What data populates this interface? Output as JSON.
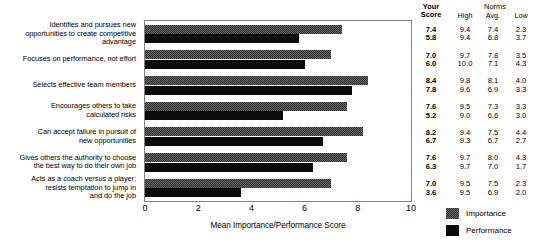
{
  "chart_data": {
    "type": "bar",
    "orientation": "horizontal",
    "title": "",
    "xlabel": "Mean Importance/Performance Score",
    "ylabel": "",
    "xlim": [
      0,
      10
    ],
    "xticks": [
      "0",
      "2",
      "4",
      "6",
      "8",
      "10"
    ],
    "grid": false,
    "legend_position": "right-bottom",
    "categories": [
      "Identifies and pursues new opportunities to create competitive advantage",
      "Focuses on performance, not effort",
      "Selects effective team members",
      "Encourages others to take calculated risks",
      "Can accept failure in pursuit of new opportunities",
      "Gives others the authority to choose the best way to do their own job",
      "Acts as a coach versus a player; resists temptation to jump in and do the job"
    ],
    "category_lines": [
      [
        "Identifies and pursues new",
        "opportunities to create competitive",
        "advantage"
      ],
      [
        "Focuses on performance, not effort"
      ],
      [
        "Selects effective team members"
      ],
      [
        "Encourages others to take",
        "calculated risks"
      ],
      [
        "Can accept failure in pursuit of",
        "new opportunities"
      ],
      [
        "Gives others the authority to choose",
        "the best way to do their own job"
      ],
      [
        "Acts as a coach versus a player;",
        "resists temptation to jump in",
        "and do the job"
      ]
    ],
    "series": [
      {
        "name": "Importance",
        "color": "#6d6d6d",
        "values": [
          7.4,
          7.0,
          8.4,
          7.6,
          8.2,
          7.6,
          7.0
        ]
      },
      {
        "name": "Performance",
        "color": "#0b0b0b",
        "values": [
          5.8,
          6.0,
          7.8,
          5.2,
          6.7,
          6.3,
          3.6
        ]
      }
    ]
  },
  "score_table": {
    "header": {
      "your_score_line1": "Your",
      "your_score_line2": "Score",
      "norms": "Norms",
      "high": "High",
      "avg": "Avg.",
      "low": "Low"
    },
    "rows": [
      {
        "your_importance": "7.4",
        "your_performance": "5.8",
        "high_importance": "9.4",
        "high_performance": "9.4",
        "avg_importance": "7.4",
        "avg_performance": "6.8",
        "low_importance": "2.3",
        "low_performance": "3.7"
      },
      {
        "your_importance": "7.0",
        "your_performance": "6.0",
        "high_importance": "9.7",
        "high_performance": "10.0",
        "avg_importance": "7.8",
        "avg_performance": "7.1",
        "low_importance": "3.5",
        "low_performance": "4.3"
      },
      {
        "your_importance": "8.4",
        "your_performance": "7.8",
        "high_importance": "9.8",
        "high_performance": "9.6",
        "avg_importance": "8.1",
        "avg_performance": "6.9",
        "low_importance": "4.0",
        "low_performance": "3.3"
      },
      {
        "your_importance": "7.6",
        "your_performance": "5.2",
        "high_importance": "9.5",
        "high_performance": "9.0",
        "avg_importance": "7.3",
        "avg_performance": "6.6",
        "low_importance": "3.3",
        "low_performance": "3.0"
      },
      {
        "your_importance": "8.2",
        "your_performance": "6.7",
        "high_importance": "9.4",
        "high_performance": "9.3",
        "avg_importance": "7.5",
        "avg_performance": "6.7",
        "low_importance": "4.4",
        "low_performance": "2.7"
      },
      {
        "your_importance": "7.6",
        "your_performance": "6.3",
        "high_importance": "9.7",
        "high_performance": "9.7",
        "avg_importance": "8.0",
        "avg_performance": "7.0",
        "low_importance": "4.3",
        "low_performance": "1.7"
      },
      {
        "your_importance": "7.0",
        "your_performance": "3.6",
        "high_importance": "9.5",
        "high_performance": "9.5",
        "avg_importance": "7.5",
        "avg_performance": "6.9",
        "low_importance": "2.3",
        "low_performance": "2.0"
      }
    ]
  },
  "legend": {
    "items": [
      {
        "label": "Importance",
        "swatch": "importance"
      },
      {
        "label": "Performance",
        "swatch": "performance"
      }
    ]
  }
}
